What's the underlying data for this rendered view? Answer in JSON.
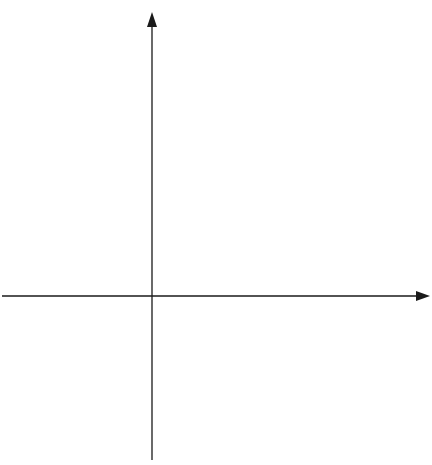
{
  "diagram": {
    "type": "slope-field-isoclines",
    "equation_implied": "dy/dx = 2x + y",
    "axes": {
      "x_label": "x",
      "y_label": "y",
      "x_ticks": [
        {
          "value": -1,
          "label": "-1"
        },
        {
          "value": 1,
          "label": "1"
        }
      ],
      "y_ticks": [
        {
          "value": 1,
          "label": "1"
        },
        {
          "value": -1,
          "label": "-1"
        }
      ]
    },
    "isoclines": [
      {
        "c": -2,
        "label": "c = −2"
      },
      {
        "c": -1,
        "label": "c = −1"
      },
      {
        "c": 0,
        "label": "c = 0"
      },
      {
        "c": 1,
        "label": "c = 1"
      },
      {
        "c": 2,
        "label": "c = 2"
      },
      {
        "c": 3,
        "label": "c = 3"
      },
      {
        "c": 4,
        "label": "c = 4"
      },
      {
        "c": 5,
        "label": "c = 5"
      }
    ],
    "solution_curves_C": [
      -0.05,
      0,
      0.3,
      0.7,
      1.0,
      1.4,
      2.0,
      2.6,
      3.3,
      4.0,
      4.8
    ]
  },
  "colors": {
    "ink": "#1a1a1a",
    "paper": "#ffffff"
  }
}
